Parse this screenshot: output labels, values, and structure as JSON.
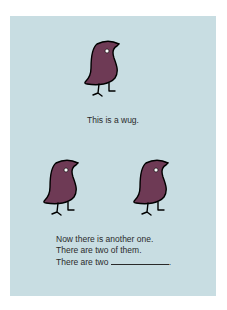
{
  "figure": {
    "background_color": "#c8dde2",
    "bird_color": "#6e3a55",
    "top_caption": "This is a wug.",
    "bottom_lines": [
      "Now there is another one.",
      "There are two of them.",
      "There are two"
    ],
    "blank_suffix": "."
  }
}
